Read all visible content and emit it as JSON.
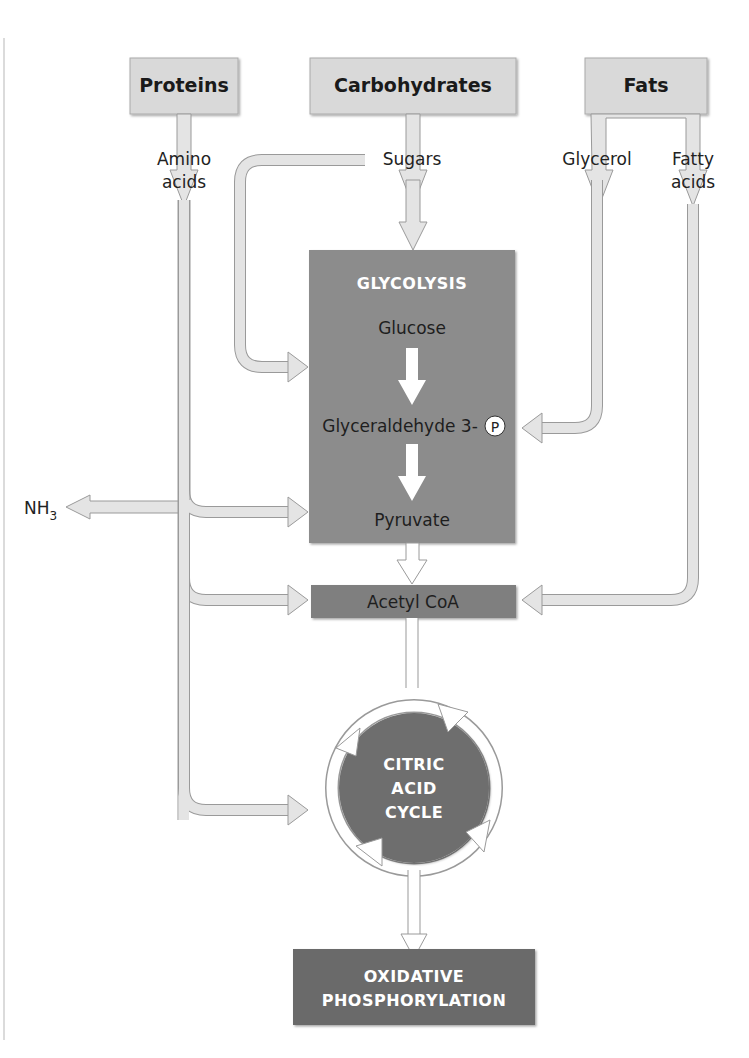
{
  "sources": {
    "proteins": "Proteins",
    "carbohydrates": "Carbohydrates",
    "fats": "Fats"
  },
  "intermediates": {
    "amino_acids_line1": "Amino",
    "amino_acids_line2": "acids",
    "sugars": "Sugars",
    "glycerol": "Glycerol",
    "fatty_acids_line1": "Fatty",
    "fatty_acids_line2": "acids"
  },
  "glycolysis": {
    "title": "GLYCOLYSIS",
    "glucose": "Glucose",
    "g3p": "Glyceraldehyde 3-",
    "phosphate_symbol": "P",
    "pyruvate": "Pyruvate"
  },
  "byproduct": {
    "nh": "NH",
    "subscript": "3"
  },
  "acetyl_coa": "Acetyl CoA",
  "citric_acid_cycle": {
    "line1": "CITRIC",
    "line2": "ACID",
    "line3": "CYCLE"
  },
  "oxidative_phosphorylation": {
    "line1": "OXIDATIVE",
    "line2": "PHOSPHORYLATION"
  },
  "colors": {
    "source_box": "#d9d9d9",
    "glycolysis_box": "#8c8c8c",
    "acetyl_box": "#7f7f7f",
    "cycle_circle": "#6e6e6e",
    "oxphos_box": "#6a6a6a",
    "arrow_fill": "#e4e4e4"
  }
}
